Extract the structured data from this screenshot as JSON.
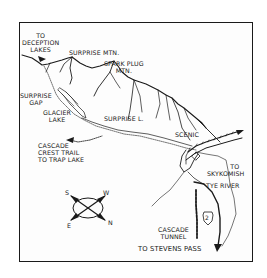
{
  "map": {
    "labels": {
      "to_deception_lakes": [
        "TO",
        "DECEPTION",
        "LAKES"
      ],
      "surprise_mtn": "SURPRISE MTN.",
      "spark_plug_mtn": [
        "SPARK PLUG",
        "MTN."
      ],
      "surprise_gap": [
        "SURPRISE",
        "GAP"
      ],
      "glacier_lake": [
        "GLACIER",
        "LAKE"
      ],
      "surprise_lake": "SURPRISE L.",
      "scenic": "SCENIC",
      "cascade_crest_trail": [
        "CASCADE",
        "CREST TRAIL",
        "TO TRAP LAKE"
      ],
      "to_skykomish": [
        "TO",
        "SKYKOMISH"
      ],
      "tye_river": "TYE RIVER",
      "cascade_tunnel": [
        "CASCADE",
        "TUNNEL"
      ],
      "to_stevens_pass": "TO STEVENS PASS",
      "highway_shield": "2"
    },
    "compass": {
      "S": "S",
      "W": "W",
      "E": "E",
      "N": "N"
    },
    "colors": {
      "ink": "#1a1a1a",
      "paper": "#fdfdfd"
    }
  }
}
